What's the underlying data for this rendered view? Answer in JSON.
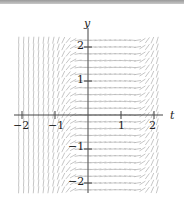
{
  "chart_data": {
    "type": "slope-field",
    "title": "",
    "xlabel": "t",
    "ylabel": "y",
    "xlim": [
      -2.2,
      2.2
    ],
    "ylim": [
      -2.3,
      2.3
    ],
    "x_ticks": [
      -2,
      -1,
      1,
      2
    ],
    "y_ticks": [
      2,
      1,
      -1,
      -2
    ],
    "x_tick_labels": [
      "−2",
      "−1",
      "1",
      "2"
    ],
    "y_tick_labels": [
      "2",
      "1",
      "−1",
      "−2"
    ],
    "grid": false,
    "segment_color": "#b8b8b8",
    "axis_color": "#444444"
  },
  "labels": {
    "x_axis": "t",
    "y_axis": "y",
    "ticks_x": [
      "−2",
      "−1",
      "1",
      "2"
    ],
    "ticks_y": [
      "2",
      "1",
      "−1",
      "−2"
    ]
  }
}
